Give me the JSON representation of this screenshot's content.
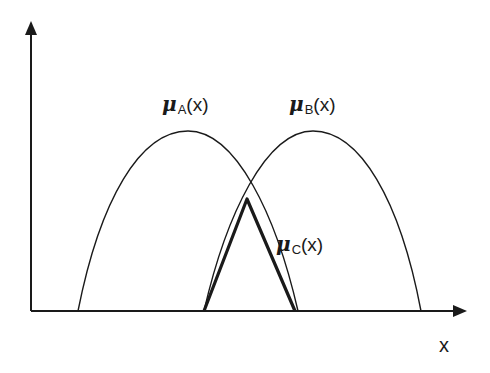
{
  "diagram": {
    "type": "fuzzy-membership-intersection",
    "colors": {
      "stroke": "#1a1a1a",
      "background": "#ffffff"
    },
    "axes": {
      "origin": [
        31,
        311
      ],
      "y_axis_top": 21,
      "x_axis_right": 466,
      "x_label": "x"
    },
    "curves": [
      {
        "id": "A",
        "mu": "μ",
        "subscript": "A",
        "arg": "(x)",
        "start_x": 78,
        "peak": [
          188,
          131
        ],
        "end_x": 298
      },
      {
        "id": "B",
        "mu": "μ",
        "subscript": "B",
        "arg": "(x)",
        "start_x": 204,
        "peak": [
          313,
          131
        ],
        "end_x": 421
      }
    ],
    "intersection": {
      "id": "C",
      "mu": "μ",
      "subscript": "C",
      "arg": "(x)",
      "base_left": 204,
      "apex": [
        247,
        199
      ],
      "base_right": 295
    }
  }
}
